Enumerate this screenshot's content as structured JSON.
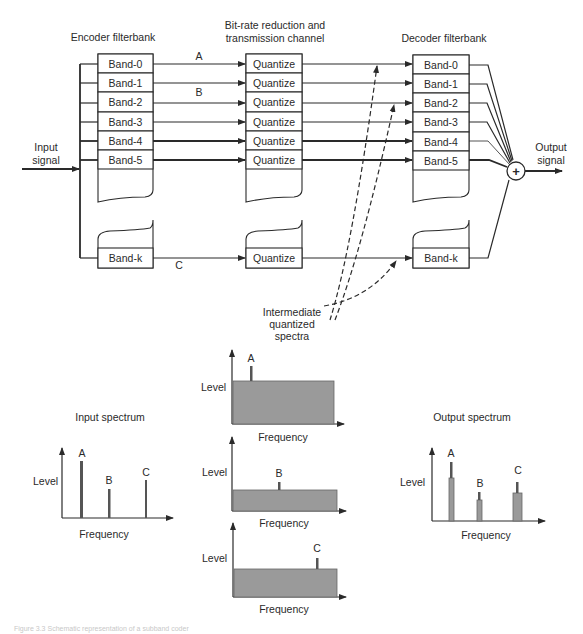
{
  "titles": {
    "encoder": "Encoder filterbank",
    "channel_line1": "Bit-rate reduction and",
    "channel_line2": "transmission channel",
    "decoder": "Decoder filterbank"
  },
  "io": {
    "input_line1": "Input",
    "input_line2": "signal",
    "output_line1": "Output",
    "output_line2": "signal",
    "summer_symbol": "+"
  },
  "encoder_bands": [
    "Band-0",
    "Band-1",
    "Band-2",
    "Band-3",
    "Band-4",
    "Band-5"
  ],
  "encoder_last_band": "Band-k",
  "quantize_blocks": [
    "Quantize",
    "Quantize",
    "Quantize",
    "Quantize",
    "Quantize",
    "Quantize"
  ],
  "quantize_last": "Quantize",
  "decoder_bands": [
    "Band-0",
    "Band-1",
    "Band-2",
    "Band-3",
    "Band-4",
    "Band-5"
  ],
  "decoder_last_band": "Band-k",
  "signal_labels": {
    "a": "A",
    "b": "B",
    "c": "C"
  },
  "annotation": {
    "line1": "Intermediate",
    "line2": "quantized",
    "line3": "spectra"
  },
  "spectra": {
    "input": {
      "title": "Input spectrum",
      "ylabel": "Level",
      "xlabel": "Frequency",
      "peaks": [
        {
          "label": "A",
          "height": 55
        },
        {
          "label": "B",
          "height": 28
        },
        {
          "label": "C",
          "height": 37
        }
      ]
    },
    "intermediate": [
      {
        "ylabel": "Level",
        "xlabel": "Frequency",
        "peak_label": "A"
      },
      {
        "ylabel": "Level",
        "xlabel": "Frequency",
        "peak_label": "B"
      },
      {
        "ylabel": "Level",
        "xlabel": "Frequency",
        "peak_label": "C"
      }
    ],
    "output": {
      "title": "Output spectrum",
      "ylabel": "Level",
      "xlabel": "Frequency",
      "peaks": [
        {
          "label": "A",
          "height": 58,
          "noise_floor": 42
        },
        {
          "label": "B",
          "height": 29,
          "noise_floor": 21
        },
        {
          "label": "C",
          "height": 38,
          "noise_floor": 27
        }
      ]
    }
  },
  "caption": "Figure 3.3 Schematic representation of a subband coder"
}
